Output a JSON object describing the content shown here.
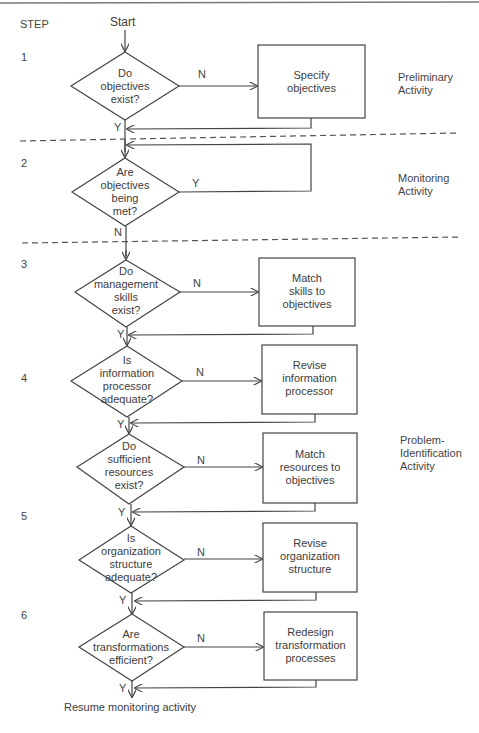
{
  "header": {
    "step_label": "STEP",
    "start_label": "Start"
  },
  "steps": [
    "1",
    "2",
    "3",
    "4",
    "5",
    "6"
  ],
  "activities": {
    "preliminary": "Preliminary\nActivity",
    "monitoring": "Monitoring\nActivity",
    "problem_identification": "Problem-\nIdentification\nActivity"
  },
  "decisions": [
    {
      "text": "Do\nobjectives\nexist?",
      "no": "N",
      "yes": "Y"
    },
    {
      "text": "Are\nobjectives\nbeing\nmet?",
      "no": "N",
      "yes": "Y"
    },
    {
      "text": "Do\nmanagement\nskills\nexist?",
      "no": "N",
      "yes": "Y"
    },
    {
      "text": "Is\ninformation\nprocessor\nadequate?",
      "no": "N",
      "yes": "Y"
    },
    {
      "text": "Do\nsufficient\nresources\nexist?",
      "no": "N",
      "yes": "Y"
    },
    {
      "text": "Is\norganization\nstructure\nadequate?",
      "no": "N",
      "yes": "Y"
    },
    {
      "text": "Are\ntransformations\nefficient?",
      "no": "N",
      "yes": "Y"
    }
  ],
  "actions": [
    "Specify\nobjectives",
    "Match\nskills to\nobjectives",
    "Revise\ninformation\nprocessor",
    "Match\nresources to\nobjectives",
    "Revise\norganization\nstructure",
    "Redesign\ntransformation\nprocesses"
  ],
  "footer": {
    "end_label": "Resume monitoring activity"
  }
}
